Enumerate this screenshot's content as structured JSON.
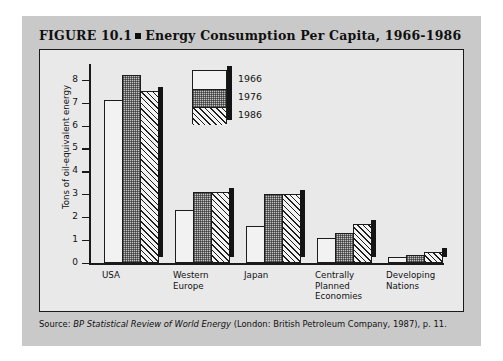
{
  "figure": {
    "number": "FIGURE 10.1",
    "title": "Energy Consumption Per Capita, 1966-1986",
    "source_prefix": "Source: ",
    "source_italic": "BP Statistical Review of World Energy",
    "source_rest": " (London: British Petroleum Company, 1987), p. 11."
  },
  "colors": {
    "card_background": "#c9c9c9",
    "plot_background": "#e9e9e9",
    "axis": "#1a1a1a",
    "bar_outline": "#1c1c1c",
    "shadow": "#141414",
    "fill_1966": "#f2f2f2",
    "fill_1976": "#c2c2c2",
    "fill_1986": "#f4f4f4"
  },
  "chart_data": {
    "type": "bar",
    "title": "Energy Consumption Per Capita, 1966-1986",
    "xlabel": "",
    "ylabel": "Tons of oil-equivalent energy",
    "ylim": [
      0,
      8.6
    ],
    "yticks": [
      0,
      1,
      2,
      3,
      4,
      5,
      6,
      7,
      8
    ],
    "ytick_labels": [
      "0",
      "1",
      "2",
      "3",
      "4",
      "5",
      "6",
      "7",
      "8"
    ],
    "grid": false,
    "legend_position": "upper-center",
    "categories": [
      "USA",
      "Western Europe",
      "Japan",
      "Centrally Planned Economies",
      "Developing Nations"
    ],
    "category_lines": [
      [
        "USA"
      ],
      [
        "Western",
        "Europe"
      ],
      [
        "Japan"
      ],
      [
        "Centrally",
        "Planned",
        "Economies"
      ],
      [
        "Developing",
        "Nations"
      ]
    ],
    "series": [
      {
        "name": "1966",
        "pattern": "solid-white",
        "values": [
          7.1,
          2.3,
          1.6,
          1.1,
          0.25
        ]
      },
      {
        "name": "1976",
        "pattern": "gray-dotted",
        "values": [
          8.2,
          3.1,
          3.0,
          1.3,
          0.35
        ]
      },
      {
        "name": "1986",
        "pattern": "diagonal-hatch",
        "values": [
          7.5,
          3.1,
          3.0,
          1.7,
          0.5
        ]
      }
    ]
  }
}
